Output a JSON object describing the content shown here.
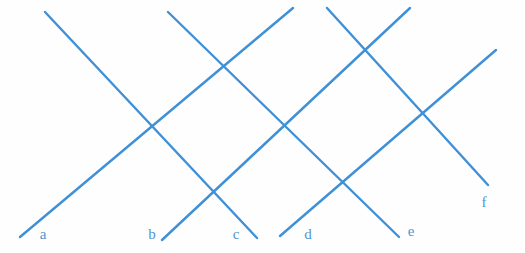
{
  "diagram": {
    "canvas": {
      "width": 525,
      "height": 253,
      "background": "#fefefe"
    },
    "line_color": "#3f90d6",
    "label_color": "#4f96d2",
    "stroke_width": 2.4,
    "lines": [
      {
        "name": "a",
        "x1": 20,
        "y1": 237,
        "x2": 293,
        "y2": 8
      },
      {
        "name": "b",
        "x1": 162,
        "y1": 240,
        "x2": 410,
        "y2": 8
      },
      {
        "name": "c",
        "x1": 45,
        "y1": 12,
        "x2": 257,
        "y2": 238
      },
      {
        "name": "d",
        "x1": 280,
        "y1": 236,
        "x2": 496,
        "y2": 50
      },
      {
        "name": "e",
        "x1": 168,
        "y1": 12,
        "x2": 399,
        "y2": 237
      },
      {
        "name": "f",
        "x1": 327,
        "y1": 8,
        "x2": 488,
        "y2": 185
      }
    ],
    "labels": [
      {
        "text": "a",
        "x": 43,
        "y": 239
      },
      {
        "text": "b",
        "x": 152,
        "y": 239
      },
      {
        "text": "c",
        "x": 236,
        "y": 239
      },
      {
        "text": "d",
        "x": 308,
        "y": 239
      },
      {
        "text": "e",
        "x": 411,
        "y": 236
      },
      {
        "text": "f",
        "x": 484,
        "y": 207
      }
    ]
  }
}
